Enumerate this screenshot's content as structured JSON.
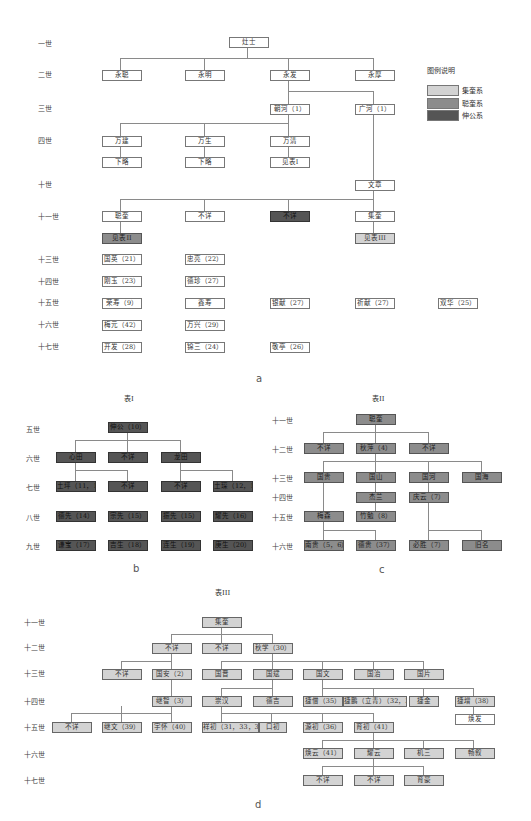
{
  "colors": {
    "light": "#d3d3d3",
    "mid": "#8c8c8c",
    "dark": "#555555",
    "line": "#8a8a8a"
  },
  "legend": {
    "title": "图例说明",
    "items": [
      {
        "label": "集奎系",
        "color": "#d3d3d3"
      },
      {
        "label": "聪奎系",
        "color": "#8c8c8c"
      },
      {
        "label": "伸公系",
        "color": "#555555"
      }
    ]
  },
  "panel_a": {
    "caption": "a",
    "generations": [
      "一世",
      "二世",
      "三世",
      "四世",
      "十世",
      "十一世",
      "十三世",
      "十四世",
      "十五世",
      "十六世",
      "十七世"
    ],
    "nodes": {
      "g1": [
        "灶士"
      ],
      "g2": [
        "永聪",
        "永明",
        "永发",
        "永厚"
      ],
      "g3": [
        "朝河（1）",
        "广河（1）"
      ],
      "g4": [
        "万建",
        "万生",
        "万清"
      ],
      "g4b": [
        "下略",
        "下略",
        "见表I"
      ],
      "g10": [
        "文章"
      ],
      "g11": [
        "聪奎",
        "不详",
        "不详",
        "集奎"
      ],
      "g11b": [
        "见表II",
        "见表III"
      ],
      "g13": [
        "国英（21）",
        "忠亮（22）"
      ],
      "g14": [
        "刚玉（23）",
        "德珍（27）"
      ],
      "g15": [
        "荣寿（9）",
        "鑫寿",
        "银献（27）",
        "祈献（27）",
        "双华（25）"
      ],
      "g16": [
        "梅元（42）",
        "万兴（29）"
      ],
      "g17": [
        "开发（28）",
        "锦三（24）",
        "敬亭（26）"
      ]
    }
  },
  "panel_b": {
    "title": "表I",
    "caption": "b",
    "generations": [
      "五世",
      "六世",
      "七世",
      "八世",
      "九世"
    ],
    "nodes": {
      "g5": [
        "伸公（10）"
      ],
      "g6": [
        "心田",
        "不详",
        "龙田"
      ],
      "g7": [
        "土坪（11，12）",
        "不详",
        "不详",
        "土琛（12，13）"
      ],
      "g8": [
        "德先（14）",
        "宗先（15）",
        "振先（15）",
        "耀先（16）"
      ],
      "g9": [
        "谦宝（17）",
        "吉生（18）",
        "连生（19）",
        "庚生（20）"
      ]
    }
  },
  "panel_c": {
    "title": "表II",
    "caption": "c",
    "generations": [
      "十一世",
      "十二世",
      "十三世",
      "十四世",
      "十五世",
      "十六世"
    ],
    "nodes": {
      "g11": [
        "聪奎"
      ],
      "g12": [
        "不详",
        "秋萍（4）",
        "不详"
      ],
      "g13": [
        "国贵",
        "国山",
        "国河",
        "国海"
      ],
      "g14": [
        "杰兰",
        "庆云（7）"
      ],
      "g15": [
        "梅森",
        "竹勉（8）"
      ],
      "g16": [
        "南贵（5，6）",
        "德贵（37）",
        "必胜（7）",
        "旧名"
      ]
    }
  },
  "panel_d": {
    "title": "表III",
    "caption": "d",
    "generations": [
      "十一世",
      "十二世",
      "十三世",
      "十四世",
      "十五世",
      "十六世",
      "十七世"
    ],
    "nodes": {
      "g11": [
        "集奎"
      ],
      "g12": [
        "不详",
        "不详",
        "秋学（30）"
      ],
      "g13": [
        "不详",
        "国安（2）",
        "国晋",
        "国斌",
        "国文",
        "国治",
        "国片"
      ],
      "g14": [
        "继智（3）",
        "崇汉",
        "德吉",
        "捷僧（35）",
        "捷鹏（立青）（32，33）",
        "捷金",
        "捷增（38）"
      ],
      "g14b": [
        "焕发"
      ],
      "g15": [
        "不详",
        "继文（39）",
        "宇怀（40）",
        "祥初（31，33，34）",
        "口初",
        "源初（36）",
        "育初（41）"
      ],
      "g16": [
        "焕云（41）",
        "耀云",
        "机三",
        "畅叙"
      ],
      "g17": [
        "不详",
        "不详",
        "育豪"
      ]
    }
  }
}
